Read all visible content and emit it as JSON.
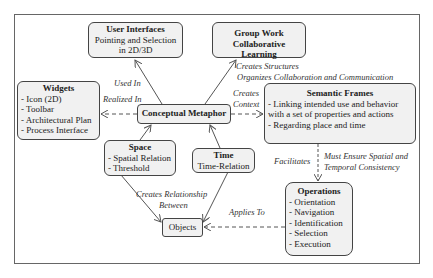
{
  "diagram": {
    "center": {
      "title": "Conceptual Metaphor"
    },
    "nodes": {
      "user_interfaces": {
        "title": "User Interfaces",
        "lines": [
          "Pointing and Selection",
          "in 2D/3D"
        ]
      },
      "group_work": {
        "title": "Group Work",
        "lines": [
          "Collaborative Learning"
        ]
      },
      "widgets": {
        "title": "Widgets",
        "items": [
          "- Icon (2D)",
          "- Toolbar",
          "- Architectural Plan",
          "- Process Interface"
        ]
      },
      "semantic_frames": {
        "title": "Semantic Frames",
        "items": [
          "- Linking intended use and behavior",
          "with a set of properties and actions",
          "- Regarding place and time"
        ]
      },
      "space": {
        "title": "Space",
        "items": [
          "- Spatial Relation",
          "- Threshold"
        ]
      },
      "time": {
        "title": "Time",
        "lines": [
          "Time-Relation"
        ]
      },
      "objects": {
        "title": "Objects"
      },
      "operations": {
        "title": "Operations",
        "items": [
          "- Orientation",
          "- Navigation",
          "- Identification",
          "- Selection",
          "- Execution"
        ]
      }
    },
    "edges": {
      "used_in": "Used In",
      "realized_in": "Realized In",
      "creates_structures": "Creates Structures",
      "organizes": "Organizes Collaboration and Communication",
      "creates": "Creates",
      "context": "Context",
      "facilitates": "Facilitates",
      "must_ensure_1": "Must Ensure Spatial and",
      "must_ensure_2": "Temporal Consistency",
      "creates_relationship": "Creates Relationship",
      "between": "Between",
      "applies_to": "Applies To"
    },
    "colors": {
      "box_fill": "#f1f1f1",
      "border": "#444444",
      "line": "#555555"
    }
  }
}
